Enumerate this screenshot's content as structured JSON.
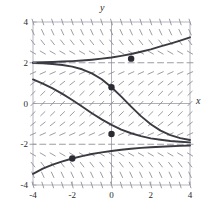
{
  "figure": {
    "axis_label_x": "x",
    "axis_label_y": "y",
    "background": "#ffffff",
    "curve_color": "#3a3a42",
    "field_color": "#8a8a92",
    "frame_color": "#b0b0b8",
    "axis_color": "#9a9aa2",
    "point_color": "#2b2b33"
  },
  "chart_data": {
    "type": "line",
    "title": "",
    "xlabel": "x",
    "ylabel": "y",
    "xlim": [
      -4,
      4
    ],
    "ylim": [
      -4,
      4
    ],
    "grid": false,
    "xticks": [
      -4,
      -2,
      0,
      2,
      4
    ],
    "yticks": [
      -4,
      -2,
      0,
      2,
      4
    ],
    "xticklabels": [
      "-4",
      "-2",
      "0",
      "2",
      "4"
    ],
    "yticklabels": [
      "-4",
      "-2",
      "0",
      "2",
      "4"
    ],
    "legend": [],
    "annotations": [],
    "slope_field": {
      "description": "direction field of dy/dx = (4 - y^2)/4",
      "x_start": -4,
      "x_end": 4,
      "x_step": 0.5,
      "y_start": -4,
      "y_end": 4,
      "y_step": 0.5,
      "tick_length_px": 6
    },
    "equilibria": [
      2,
      -2
    ],
    "series": [
      {
        "name": "solution-through-(1,2.2)",
        "x": [
          -4,
          -3.5,
          -3,
          -2.5,
          -2,
          -1.5,
          -1,
          -0.5,
          0,
          0.5,
          1,
          1.5,
          2,
          2.5,
          3,
          3.5,
          4
        ],
        "y": [
          2.02,
          2.03,
          2.04,
          2.06,
          2.08,
          2.11,
          2.15,
          2.2,
          2.26,
          2.34,
          2.43,
          2.54,
          2.66,
          2.8,
          2.94,
          3.09,
          3.25
        ]
      },
      {
        "name": "solution-through-(0,0.8)",
        "x": [
          -4,
          -3.5,
          -3,
          -2.5,
          -2,
          -1.5,
          -1,
          -0.5,
          0,
          0.5,
          1,
          1.5,
          2,
          2.5,
          3,
          3.5,
          4
        ],
        "y": [
          1.99,
          1.97,
          1.94,
          1.89,
          1.81,
          1.68,
          1.48,
          1.19,
          0.8,
          0.34,
          -0.15,
          -0.62,
          -1.02,
          -1.33,
          -1.55,
          -1.7,
          -1.79
        ]
      },
      {
        "name": "solution-through-(0,-1.5)",
        "x": [
          -4,
          -3.5,
          -3,
          -2.5,
          -2,
          -1.5,
          -1,
          -0.5,
          0,
          0.5,
          1,
          1.5,
          2,
          2.5,
          3,
          3.5,
          4
        ],
        "y": [
          1.18,
          0.98,
          0.74,
          0.47,
          0.17,
          -0.15,
          -0.48,
          -0.78,
          -1.05,
          -1.28,
          -1.46,
          -1.6,
          -1.71,
          -1.78,
          -1.84,
          -1.88,
          -1.91
        ]
      },
      {
        "name": "solution-through-(-2,-2.7)",
        "x": [
          -4,
          -3.5,
          -3,
          -2.5,
          -2,
          -1.5,
          -1,
          -0.5,
          0,
          0.5,
          1,
          1.5,
          2,
          2.5,
          3,
          3.5,
          4
        ],
        "y": [
          -3.45,
          -3.2,
          -3,
          -2.84,
          -2.7,
          -2.58,
          -2.48,
          -2.4,
          -2.33,
          -2.27,
          -2.22,
          -2.18,
          -2.15,
          -2.12,
          -2.1,
          -2.08,
          -2.06
        ]
      }
    ],
    "marked_points": [
      {
        "x": 1,
        "y": 2.2
      },
      {
        "x": 0,
        "y": 0.8
      },
      {
        "x": 0,
        "y": -1.5
      },
      {
        "x": -2,
        "y": -2.7
      }
    ]
  }
}
